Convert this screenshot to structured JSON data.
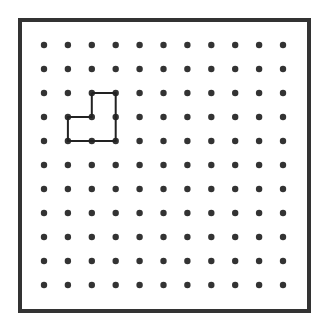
{
  "diagram": {
    "type": "dot-grid",
    "frame": {
      "x": 20,
      "y": 20,
      "width": 289,
      "height": 291,
      "stroke": "#333333",
      "stroke_width": 4
    },
    "grid": {
      "cols": 11,
      "rows": 11,
      "origin_x": 44,
      "origin_y": 45,
      "spacing_x": 23.9,
      "spacing_y": 24.0,
      "dot_radius": 3.2,
      "dot_color": "#333333"
    },
    "shape": {
      "stroke": "#222222",
      "stroke_width": 2,
      "points": [
        [
          2,
          2
        ],
        [
          3,
          2
        ],
        [
          3,
          4
        ],
        [
          1,
          4
        ],
        [
          1,
          3
        ],
        [
          2,
          3
        ],
        [
          2,
          2
        ]
      ]
    }
  }
}
